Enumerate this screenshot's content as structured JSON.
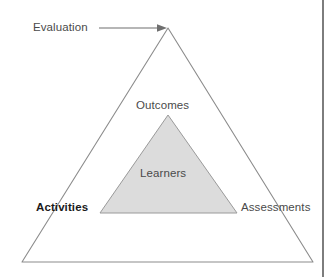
{
  "diagram": {
    "background_color": "#ffffff",
    "outer_triangle": {
      "name": "outer-triangle",
      "fill": "none",
      "stroke": "#8c8c8c",
      "stroke_width": 1,
      "apex": {
        "x": 168,
        "y": 28
      },
      "bottom_left": {
        "x": 22,
        "y": 262
      },
      "bottom_right": {
        "x": 313,
        "y": 262
      }
    },
    "inner_triangle": {
      "name": "inner-triangle",
      "fill": "#dcdcdc",
      "stroke": "#8c8c8c",
      "stroke_width": 1,
      "apex": {
        "x": 168,
        "y": 115
      },
      "bottom_left": {
        "x": 100,
        "y": 213
      },
      "bottom_right": {
        "x": 237,
        "y": 213
      }
    },
    "arrow": {
      "name": "evaluation-arrow",
      "stroke": "#6f6f6f",
      "from": {
        "x": 99,
        "y": 28
      },
      "to": {
        "x": 166,
        "y": 28
      }
    },
    "labels": {
      "evaluation": "Evaluation",
      "outcomes": "Outcomes",
      "learners": "Learners",
      "activities": "Activities",
      "assessments": "Assessments"
    },
    "page_edge": {
      "name": "page-edge-line",
      "color": "#7d7d7d"
    }
  }
}
